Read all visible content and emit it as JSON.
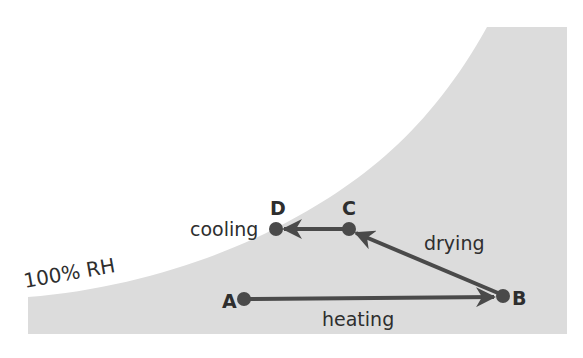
{
  "diagram": {
    "type": "psychrometric-process",
    "colors": {
      "background": "#ffffff",
      "region_fill": "#dcdcdc",
      "stroke": "#4a4a4a",
      "text": "#2e2e2e"
    },
    "saturation_curve": {
      "label": "100% RH"
    },
    "points": [
      {
        "id": "A",
        "label": "A"
      },
      {
        "id": "B",
        "label": "B"
      },
      {
        "id": "C",
        "label": "C"
      },
      {
        "id": "D",
        "label": "D"
      }
    ],
    "processes": [
      {
        "from": "A",
        "to": "B",
        "label": "heating"
      },
      {
        "from": "B",
        "to": "C",
        "label": "drying"
      },
      {
        "from": "C",
        "to": "D",
        "label": "cooling"
      }
    ]
  }
}
